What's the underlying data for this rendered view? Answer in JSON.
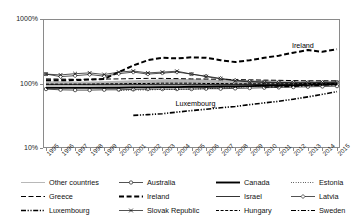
{
  "chart_data": {
    "type": "line",
    "title": "",
    "xlabel": "",
    "ylabel": "",
    "yscale": "log",
    "ylim": [
      10,
      1000
    ],
    "ytick_labels": [
      "1000%",
      "100%",
      "10%"
    ],
    "ytick_values": [
      1000,
      100,
      10
    ],
    "grid": false,
    "legend_position": "bottom",
    "x": [
      "1995",
      "1996",
      "1997",
      "1998",
      "1999",
      "2000",
      "2001",
      "2002",
      "2003",
      "2004",
      "2005",
      "2006",
      "2007",
      "2008",
      "2009",
      "2010",
      "2011",
      "2012",
      "2013",
      "2014",
      "2015"
    ],
    "annotations": [
      {
        "text": "Ireland",
        "x": "2013",
        "y": 330
      },
      {
        "text": "Luxembourg",
        "x": "2005",
        "y": 42
      }
    ],
    "band": {
      "name": "Other countries range",
      "upper": [
        108,
        108,
        107,
        107,
        108,
        110,
        112,
        114,
        116,
        117,
        117,
        115,
        113,
        112,
        112,
        112,
        111,
        110,
        110,
        110,
        110
      ],
      "lower": [
        92,
        92,
        92,
        91,
        90,
        89,
        88,
        87,
        86,
        86,
        86,
        86,
        87,
        88,
        89,
        90,
        91,
        92,
        93,
        94,
        95
      ]
    },
    "series": [
      {
        "name": "Other countries",
        "style": "thin-solid-gray",
        "values": [
          100,
          100,
          99,
          99,
          100,
          101,
          102,
          103,
          104,
          104,
          104,
          103,
          102,
          101,
          101,
          101,
          101,
          100,
          100,
          100,
          100
        ]
      },
      {
        "name": "Australia",
        "style": "circle-marker",
        "values": [
          82,
          80,
          79,
          79,
          80,
          80,
          81,
          82,
          82,
          82,
          82,
          83,
          83,
          84,
          85,
          86,
          87,
          88,
          89,
          90,
          91
        ]
      },
      {
        "name": "Canada",
        "style": "thick-solid",
        "values": [
          86,
          86,
          86,
          86,
          86,
          86,
          87,
          87,
          88,
          88,
          89,
          89,
          90,
          90,
          91,
          92,
          93,
          94,
          95,
          96,
          97
        ]
      },
      {
        "name": "Estonia",
        "style": "dotted",
        "values": [
          null,
          null,
          null,
          null,
          null,
          78,
          79,
          80,
          81,
          81,
          82,
          83,
          85,
          87,
          89,
          92,
          95,
          97,
          98,
          99,
          100
        ]
      },
      {
        "name": "Greece",
        "style": "dashed",
        "values": [
          118,
          117,
          116,
          116,
          117,
          118,
          119,
          120,
          120,
          119,
          118,
          117,
          116,
          115,
          114,
          113,
          112,
          111,
          110,
          110,
          110
        ]
      },
      {
        "name": "Ireland",
        "style": "bold-dashed",
        "values": [
          112,
          112,
          113,
          115,
          118,
          150,
          190,
          230,
          250,
          245,
          255,
          250,
          230,
          215,
          230,
          250,
          270,
          300,
          330,
          310,
          340
        ]
      },
      {
        "name": "Israel",
        "style": "thin-solid",
        "values": [
          96,
          96,
          96,
          96,
          96,
          96,
          96,
          96,
          96,
          96,
          96,
          96,
          96,
          96,
          96,
          97,
          97,
          98,
          98,
          99,
          99
        ]
      },
      {
        "name": "Latvia",
        "style": "diamond-marker",
        "values": [
          140,
          128,
          132,
          138,
          130,
          142,
          150,
          140,
          145,
          150,
          140,
          130,
          120,
          112,
          108,
          105,
          104,
          103,
          103,
          104,
          105
        ]
      },
      {
        "name": "Luxembourg",
        "style": "dash-dot-dot",
        "values": [
          null,
          null,
          null,
          null,
          null,
          null,
          32,
          33,
          34,
          36,
          38,
          40,
          42,
          44,
          47,
          50,
          53,
          57,
          62,
          68,
          75
        ]
      },
      {
        "name": "Slovak Republic",
        "style": "x-marker",
        "values": [
          140,
          136,
          142,
          146,
          138,
          150,
          156,
          146,
          150,
          155,
          140,
          128,
          118,
          110,
          106,
          104,
          103,
          102,
          102,
          103,
          104
        ]
      },
      {
        "name": "Hungary",
        "style": "dashed-thin",
        "values": [
          98,
          98,
          98,
          98,
          99,
          99,
          100,
          100,
          101,
          101,
          101,
          100,
          100,
          99,
          99,
          99,
          99,
          99,
          100,
          100,
          100
        ]
      },
      {
        "name": "Sweden",
        "style": "dash-dot",
        "values": [
          null,
          null,
          null,
          null,
          null,
          null,
          null,
          null,
          null,
          null,
          null,
          null,
          null,
          null,
          null,
          88,
          89,
          90,
          92,
          94,
          96
        ]
      }
    ]
  },
  "legend": {
    "rows": [
      [
        {
          "label": "Other countries",
          "style": "thin-solid-gray"
        },
        {
          "label": "Australia",
          "style": "circle-marker"
        },
        {
          "label": "Canada",
          "style": "thick-solid"
        },
        {
          "label": "Estonia",
          "style": "dotted"
        }
      ],
      [
        {
          "label": "Greece",
          "style": "dashed"
        },
        {
          "label": "Ireland",
          "style": "bold-dashed"
        },
        {
          "label": "Israel",
          "style": "thin-solid"
        },
        {
          "label": "Latvia",
          "style": "diamond-marker"
        }
      ],
      [
        {
          "label": "Luxembourg",
          "style": "dash-dot-dot"
        },
        {
          "label": "Slovak Republic",
          "style": "x-marker"
        },
        {
          "label": "Hungary",
          "style": "dashed-thin"
        },
        {
          "label": "Sweden",
          "style": "dash-dot"
        }
      ]
    ]
  },
  "colors": {
    "axis": "#8a8a8a",
    "band": "#9d9d9d",
    "line": "#1a1a1a",
    "gray_line": "#b0b0b0"
  }
}
